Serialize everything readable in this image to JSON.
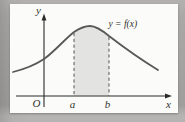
{
  "colors": {
    "surround": "#a9a8a6",
    "paper": "#fbfbf9",
    "shade": "#e3e3e1",
    "curve": "#58575500",
    "curve_stroke": "#595856",
    "axis": "#2b2a28",
    "dash": "#565550",
    "text": "#34332f"
  },
  "labels": {
    "curve": "y = f(x)",
    "y_axis": "y",
    "x_axis": "x",
    "origin": "O",
    "a": "a",
    "b": "b"
  },
  "figure": {
    "curve_path": "M13,72 C25,69 35,65 44,59 C54,52 64,40 74,32 C80,28 85,26 90,26 C96,26 103,31 109,36 C122,46 140,59 158,70",
    "shade_path": "M74,32 C80,28 85,26 90,26 C96,26 103,31 109,36 L109,95.5 L74,95.5 Z",
    "dash_a": {
      "x1": "74",
      "y1": "33",
      "x2": "74",
      "y2": "95.5"
    },
    "dash_b": {
      "x1": "109",
      "y1": "37",
      "x2": "109",
      "y2": "95.5"
    },
    "x_axis_line": {
      "x1": "16",
      "y1": "96",
      "x2": "166.5",
      "y2": "96"
    },
    "y_axis_line": {
      "x1": "44",
      "y1": "19.5",
      "x2": "44",
      "y2": "107"
    },
    "x_arrowhead": "172,96 165,93.6 165,98.4",
    "y_arrowhead": "44,13.5 41.6,20.5 46.4,20.5"
  }
}
